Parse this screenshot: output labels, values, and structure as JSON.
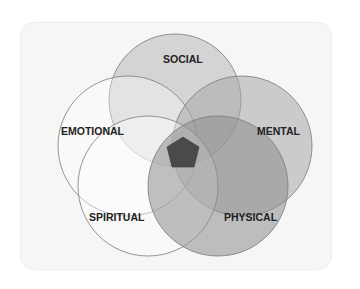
{
  "diagram": {
    "type": "five-set-venn",
    "sets": [
      {
        "id": "social",
        "label": "SOCIAL",
        "cx": 175,
        "cy": 100,
        "r": 66,
        "fill": "#b8b8b8",
        "opacity": 0.55
      },
      {
        "id": "emotional",
        "label": "EMOTIONAL",
        "cx": 128,
        "cy": 146,
        "r": 70,
        "fill": "#ffffff",
        "opacity": 0.35
      },
      {
        "id": "mental",
        "label": "MENTAL",
        "cx": 242,
        "cy": 146,
        "r": 70,
        "fill": "#a8a8a8",
        "opacity": 0.55
      },
      {
        "id": "spiritual",
        "label": "SPIRITUAL",
        "cx": 148,
        "cy": 186,
        "r": 70,
        "fill": "#ffffff",
        "opacity": 0.4
      },
      {
        "id": "physical",
        "label": "PHYSICAL",
        "cx": 218,
        "cy": 186,
        "r": 70,
        "fill": "#8e8e8e",
        "opacity": 0.55
      }
    ],
    "center": {
      "fill": "#4a4a4a"
    }
  }
}
